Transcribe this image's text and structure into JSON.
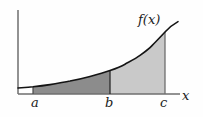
{
  "figure": {
    "type": "math-diagram",
    "background_color": "#fefefe",
    "axes": {
      "line_color": "#6e6e6e",
      "x_axis": {
        "label": "x",
        "y_px": 94,
        "x_start_px": 18,
        "x_end_px": 180
      },
      "y_axis": {
        "label": "",
        "x_px": 18,
        "y_top_px": 10,
        "y_bottom_px": 94
      }
    },
    "curve": {
      "label": "f(x)",
      "color": "#141414",
      "stroke_width": 1.6,
      "points": [
        [
          18,
          88.0
        ],
        [
          33,
          86.8
        ],
        [
          50,
          84.6
        ],
        [
          70,
          81.0
        ],
        [
          90,
          76.4
        ],
        [
          110,
          70.6
        ],
        [
          125,
          64.2
        ],
        [
          140,
          55.4
        ],
        [
          152,
          45.6
        ],
        [
          165,
          32.0
        ],
        [
          172,
          26.2
        ],
        [
          178,
          21.6
        ]
      ]
    },
    "marks": {
      "a": {
        "label": "a",
        "x_px": 33,
        "curve_y_px": 86.8
      },
      "b": {
        "label": "b",
        "x_px": 110,
        "curve_y_px": 70.6
      },
      "c": {
        "label": "c",
        "x_px": 165,
        "curve_y_px": 32.0
      }
    },
    "regions": [
      {
        "name": "region-a-to-b",
        "from": "a",
        "to": "b",
        "fill_color": "#8c8c8c",
        "shade": "dark"
      },
      {
        "name": "region-b-to-c",
        "from": "b",
        "to": "c",
        "fill_color": "#c9c9c9",
        "shade": "light"
      },
      {
        "name": "region-origin-to-a",
        "from": "origin",
        "to": "a",
        "fill_color": "#ffffff",
        "shade": "none"
      }
    ],
    "labels": {
      "function": "f(x)",
      "x_axis": "x",
      "point_a": "a",
      "point_b": "b",
      "point_c": "c"
    }
  }
}
